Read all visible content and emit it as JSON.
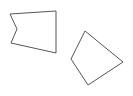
{
  "canvas": {
    "width": 133,
    "height": 96,
    "background_color": "#ffffff"
  },
  "style": {
    "stroke_color": "#555555",
    "fill_color": "#ffffff",
    "stroke_width": 1
  },
  "shapes": [
    {
      "id": "left-polygon",
      "name": "concave-pentagon",
      "description": "Concave pentagon with a notch on the left side, flag or arrow-tail like, wider on the right",
      "vertex_count": 5,
      "points": "10,14 56,11 56,53 11,43 17,29",
      "vertices": [
        {
          "x": 10,
          "y": 14
        },
        {
          "x": 56,
          "y": 11
        },
        {
          "x": 56,
          "y": 53
        },
        {
          "x": 11,
          "y": 43
        },
        {
          "x": 17,
          "y": 29
        }
      ]
    },
    {
      "id": "right-polygon",
      "name": "rotated-quadrilateral",
      "description": "Rotated convex quadrilateral, kite like, tilted clockwise",
      "vertex_count": 4,
      "points": "85,31 123,62 88,85 71,59",
      "vertices": [
        {
          "x": 85,
          "y": 31
        },
        {
          "x": 123,
          "y": 62
        },
        {
          "x": 88,
          "y": 85
        },
        {
          "x": 71,
          "y": 59
        }
      ]
    }
  ]
}
